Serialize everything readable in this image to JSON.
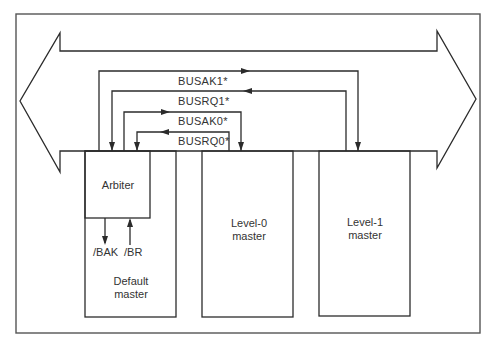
{
  "diagram": {
    "type": "bus-arbitration-block-diagram",
    "bus": {
      "label": ""
    },
    "signals": [
      {
        "id": "busak1",
        "label": "BUSAK1*",
        "direction": "to-level-1"
      },
      {
        "id": "busrq1",
        "label": "BUSRQ1*",
        "direction": "to-arbiter"
      },
      {
        "id": "busak0",
        "label": "BUSAK0*",
        "direction": "to-level-0"
      },
      {
        "id": "busrq0",
        "label": "BUSRQ0*",
        "direction": "to-arbiter"
      }
    ],
    "blocks": {
      "arbiter": {
        "label": "Arbiter"
      },
      "default_master": {
        "line1": "Default",
        "line2": "master"
      },
      "level0": {
        "line1": "Level-0",
        "line2": "master"
      },
      "level1": {
        "line1": "Level-1",
        "line2": "master"
      }
    },
    "local_signals": {
      "bak": "/BAK",
      "br": "/BR"
    }
  }
}
